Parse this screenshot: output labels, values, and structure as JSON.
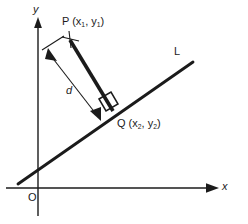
{
  "figure": {
    "background_color": "#ffffff",
    "stroke_color": "#1b1b1b",
    "axes": {
      "x_label": "x",
      "y_label": "y",
      "origin_label": "O"
    },
    "line": {
      "label": "L",
      "from": [
        18,
        184
      ],
      "to": [
        193,
        62
      ]
    },
    "points": [
      {
        "name": "P",
        "label_prefix": "P (x",
        "sub1": "1",
        "label_mid": ", y",
        "sub2": "1",
        "label_suffix": ")",
        "at": [
          70,
          40
        ]
      },
      {
        "name": "Q",
        "label_prefix": "Q (x",
        "sub1": "2",
        "label_mid": ", y",
        "sub2": "2",
        "label_suffix": ")",
        "at": [
          112,
          110
        ]
      }
    ],
    "segment_pq": {
      "from": [
        70,
        40
      ],
      "to": [
        112,
        110
      ]
    },
    "distance": {
      "label": "d",
      "from": [
        47,
        57
      ],
      "to": [
        98,
        117
      ]
    },
    "right_angle_marker": {
      "at": [
        104,
        102
      ],
      "size": 13
    }
  }
}
